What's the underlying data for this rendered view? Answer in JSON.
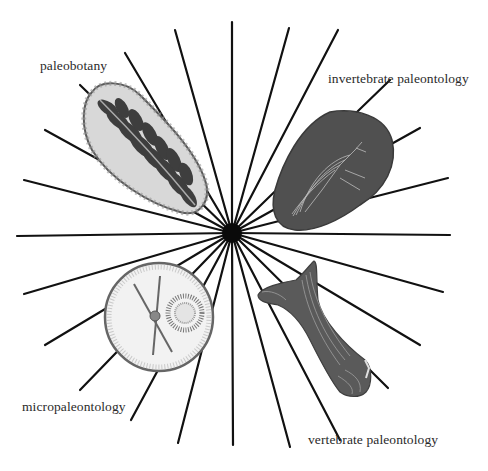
{
  "diagram": {
    "type": "radial-sunburst",
    "center": {
      "x": 232,
      "y": 233
    },
    "line_color": "#111111",
    "specimen_color": "#4a4a4a",
    "branches": [
      {
        "id": "paleobotany",
        "label": "paleobotany",
        "specimen": "fern-leaf-fossil-in-rock",
        "quadrant": "top-left"
      },
      {
        "id": "invertebrate",
        "label": "invertebrate paleontology",
        "specimen": "insect-fossil-in-rock",
        "quadrant": "top-right"
      },
      {
        "id": "micro",
        "label": "micropaleontology",
        "specimen": "microfossil-under-lens",
        "quadrant": "bottom-left"
      },
      {
        "id": "vertebrate",
        "label": "vertebrate paleontology",
        "specimen": "fossil-bone",
        "quadrant": "bottom-right"
      }
    ],
    "rays": [
      [
        232,
        22
      ],
      [
        289,
        28
      ],
      [
        338,
        30
      ],
      [
        390,
        80
      ],
      [
        420,
        128
      ],
      [
        448,
        178
      ],
      [
        450,
        235
      ],
      [
        443,
        292
      ],
      [
        420,
        345
      ],
      [
        388,
        388
      ],
      [
        340,
        440
      ],
      [
        290,
        447
      ],
      [
        233,
        445
      ],
      [
        178,
        443
      ],
      [
        131,
        420
      ],
      [
        80,
        390
      ],
      [
        45,
        345
      ],
      [
        24,
        294
      ],
      [
        17,
        236
      ],
      [
        24,
        180
      ],
      [
        45,
        130
      ],
      [
        80,
        85
      ],
      [
        125,
        53
      ],
      [
        175,
        30
      ]
    ]
  }
}
